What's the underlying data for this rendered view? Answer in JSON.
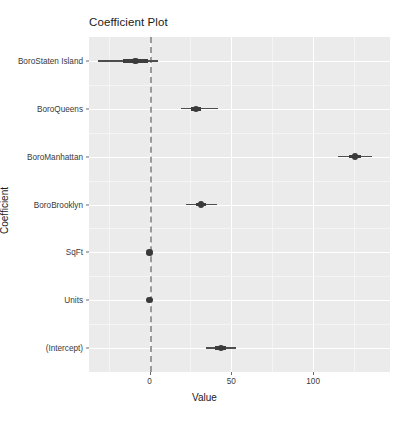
{
  "chart_data": {
    "type": "scatter",
    "title": "Coefficient Plot",
    "xlabel": "Value",
    "ylabel": "Coefficient",
    "xlim": [
      -37,
      147
    ],
    "xticks": [
      0,
      50,
      100
    ],
    "xtick_labels": [
      "0",
      "50",
      "100"
    ],
    "grid": true,
    "legend": "none",
    "zero_reference_line": 0,
    "categories": [
      "BoroStaten Island",
      "BoroQueens",
      "BoroManhattan",
      "BoroBrooklyn",
      "SqFt",
      "Units",
      "(Intercept)"
    ],
    "points": [
      {
        "label": "BoroStaten Island",
        "value": -8.6,
        "inner_low": -16.5,
        "inner_high": -1.0,
        "outer_low": -31.5,
        "outer_high": 5.2
      },
      {
        "label": "BoroQueens",
        "value": 28.5,
        "inner_low": 25.5,
        "inner_high": 31.5,
        "outer_low": 19.0,
        "outer_high": 42.0
      },
      {
        "label": "BoroManhattan",
        "value": 125.5,
        "inner_low": 122.0,
        "inner_high": 129.0,
        "outer_low": 115.5,
        "outer_high": 136.0
      },
      {
        "label": "BoroBrooklyn",
        "value": 31.5,
        "inner_low": 28.5,
        "inner_high": 34.5,
        "outer_low": 22.5,
        "outer_high": 41.0
      },
      {
        "label": "SqFt",
        "value": 0.0,
        "inner_low": -0.4,
        "inner_high": 0.4,
        "outer_low": -0.9,
        "outer_high": 0.9
      },
      {
        "label": "Units",
        "value": 0.0,
        "inner_low": -0.4,
        "inner_high": 0.4,
        "outer_low": -0.9,
        "outer_high": 0.9
      },
      {
        "label": "(Intercept)",
        "value": 43.5,
        "inner_low": 40.0,
        "inner_high": 47.0,
        "outer_low": 34.5,
        "outer_high": 53.0
      }
    ],
    "colors": {
      "panel_background": "#ebebeb",
      "gridline_major": "#ffffff",
      "gridline_minor": "#f5f5f5",
      "point": "#3a3a3a",
      "interval": "#4d4d4d",
      "zero_line": "#9a9a9a",
      "text": "#1a1a1a"
    }
  }
}
